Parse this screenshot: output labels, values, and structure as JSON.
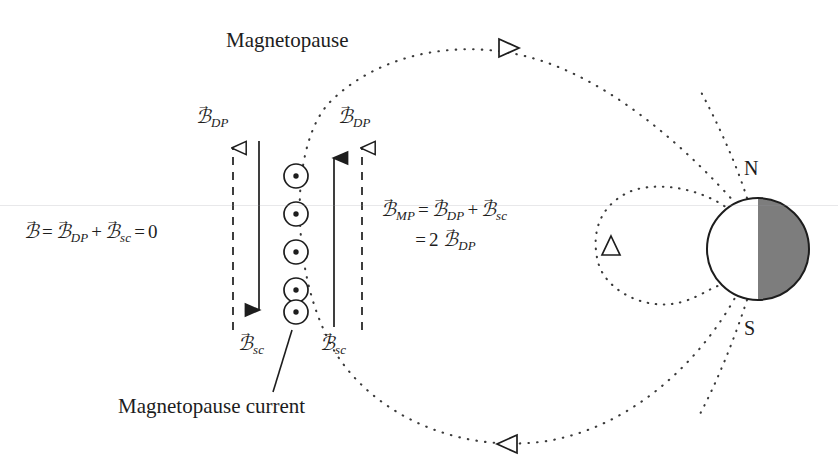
{
  "figure": {
    "title_label": "Magnetopause",
    "current_label": "Magnetopause current",
    "pole_north": "N",
    "pole_south": "S",
    "colors": {
      "ink": "#1d1d1d",
      "night_side": "#7d7d7d",
      "background": "#ffffff",
      "dotted_line": "#404040"
    }
  },
  "vectors": {
    "b_symbol": "ℬ",
    "vector_accent": "→",
    "dp_subscript": "DP",
    "sc_subscript": "sc",
    "mp_subscript": "MP",
    "left_dp_label": "B_DP",
    "left_sc_label": "B_sc",
    "right_dp_label": "B_DP",
    "right_sc_label": "B_sc"
  },
  "equations": {
    "left": {
      "lhs": "B",
      "eq1": "=",
      "term1_sub": "DP",
      "plus": "+",
      "term2_sub": "sc",
      "eq2": "=",
      "rhs": "0"
    },
    "right": {
      "lhs_sub": "MP",
      "eq1": "=",
      "term1_sub": "DP",
      "plus": "+",
      "term2_sub": "sc",
      "line2_eq": "=",
      "line2_factor": "2",
      "line2_sub": "DP"
    }
  },
  "current_sheet": {
    "symbol_name": "current-out-of-page",
    "count": 5,
    "center_x": 296,
    "first_y": 176,
    "spacing": 38,
    "radius": 12,
    "dot_radius": 2.6
  },
  "arrows": [
    {
      "name": "left-dashed-up-arrow",
      "style": "dashed",
      "head": "hollow",
      "direction": "up",
      "x": 233,
      "y_top": 144,
      "y_bottom": 330
    },
    {
      "name": "left-solid-down-arrow",
      "style": "solid",
      "head": "filled",
      "direction": "down",
      "x": 259,
      "y_top": 141,
      "y_bottom": 327
    },
    {
      "name": "right-solid-up-arrow",
      "style": "solid",
      "head": "filled",
      "direction": "up",
      "x": 334,
      "y_top": 141,
      "y_bottom": 327
    },
    {
      "name": "right-dashed-up-arrow",
      "style": "dashed",
      "head": "hollow",
      "direction": "up",
      "x": 362,
      "y_top": 144,
      "y_bottom": 330
    }
  ],
  "field_markers": [
    {
      "name": "magnetopause-arrowhead-top",
      "direction": "right",
      "x": 508,
      "y": 48
    },
    {
      "name": "magnetopause-arrowhead-bottom",
      "direction": "left",
      "x": 508,
      "y": 444
    },
    {
      "name": "dipole-fieldline-arrowhead",
      "direction": "up",
      "x": 611,
      "y": 246
    }
  ],
  "earth": {
    "center_x": 758,
    "center_y": 249,
    "radius": 51,
    "day_side": "left",
    "night_side": "right"
  }
}
